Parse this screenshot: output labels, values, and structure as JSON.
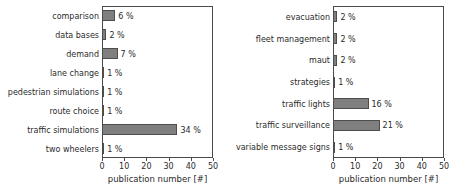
{
  "figure": {
    "background_color": "#ffffff",
    "bar_color": "#7f7f7f",
    "bar_edge_color": "#4d4d4d",
    "axis_color": "#4a4a4a",
    "text_color": "#2b2b2b"
  },
  "chart_data": [
    {
      "type": "bar",
      "orientation": "horizontal",
      "title": "",
      "xlabel": "publication number [#]",
      "ylabel": "",
      "xlim": [
        0,
        50
      ],
      "xticks": [
        0,
        10,
        20,
        30,
        40,
        50
      ],
      "xtick_labels": [
        "0",
        "10",
        "20",
        "30",
        "40",
        "50"
      ],
      "grid": false,
      "legend": "none",
      "categories": [
        "comparison",
        "data bases",
        "demand",
        "lane change",
        "pedestrian simulations",
        "route choice",
        "traffic simulations",
        "two wheelers"
      ],
      "values": [
        6,
        2,
        7,
        1,
        1,
        1,
        34,
        1
      ],
      "data_labels": [
        "6 %",
        "2 %",
        "7 %",
        "1 %",
        "1 %",
        "1 %",
        "34 %",
        "1 %"
      ]
    },
    {
      "type": "bar",
      "orientation": "horizontal",
      "title": "",
      "xlabel": "publication number [#]",
      "ylabel": "",
      "xlim": [
        0,
        50
      ],
      "xticks": [
        0,
        10,
        20,
        30,
        40,
        50
      ],
      "xtick_labels": [
        "0",
        "10",
        "20",
        "30",
        "40",
        "50"
      ],
      "grid": false,
      "legend": "none",
      "categories": [
        "evacuation",
        "fleet management",
        "maut",
        "strategies",
        "traffic lights",
        "traffic surveillance",
        "variable message signs"
      ],
      "values": [
        2,
        2,
        2,
        1,
        16,
        21,
        1
      ],
      "data_labels": [
        "2 %",
        "2 %",
        "2 %",
        "1 %",
        "16 %",
        "21 %",
        "1 %"
      ]
    }
  ]
}
